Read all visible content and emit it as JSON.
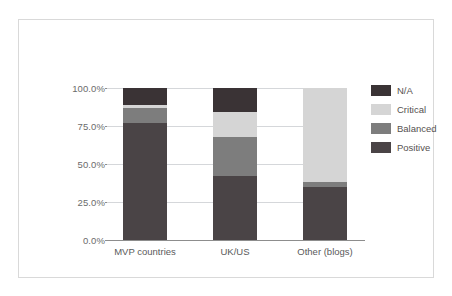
{
  "chart_data": {
    "type": "bar",
    "stacked": true,
    "normalized_percent": true,
    "title": "",
    "subtitle": "",
    "xlabel": "",
    "ylabel": "",
    "categories": [
      "MVP countries",
      "UK/US",
      "Other (blogs)"
    ],
    "series": [
      {
        "name": "Positive",
        "color": "#4a4446",
        "values": [
          77,
          42,
          35
        ]
      },
      {
        "name": "Balanced",
        "color": "#7d7d7d",
        "values": [
          10,
          26,
          3
        ]
      },
      {
        "name": "Critical",
        "color": "#d5d5d5",
        "values": [
          2,
          16,
          62
        ]
      },
      {
        "name": "N/A",
        "color": "#3a3335",
        "values": [
          11,
          16,
          0
        ]
      }
    ],
    "stack_order_bottom_to_top": [
      "Positive",
      "Balanced",
      "Critical",
      "N/A"
    ],
    "legend_order_top_to_bottom": [
      "N/A",
      "Critical",
      "Balanced",
      "Positive"
    ],
    "legend_position": "right",
    "ylim": [
      0,
      100
    ],
    "yticks": [
      0,
      25,
      50,
      75,
      100
    ],
    "ytick_labels": [
      "0.0%",
      "25.0%",
      "50.0%",
      "75.0%",
      "100.0%"
    ],
    "grid": true,
    "grid_axis": "y",
    "grid_color": "#d5d7da",
    "axis_color": "#8d8d8d",
    "border_color": "#d9d9d9",
    "background": "#ffffff",
    "tick_label_color": "#6b6b6b",
    "category_label_color": "#5a5a5a",
    "legend_text_color": "#55514f"
  }
}
